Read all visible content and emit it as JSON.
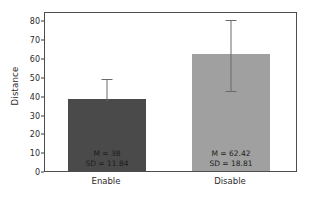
{
  "chart_data": {
    "type": "bar",
    "title": "",
    "xlabel": "",
    "ylabel": "Distance",
    "categories": [
      "Enable",
      "Disable"
    ],
    "values": [
      38,
      62.42
    ],
    "errors": [
      11.84,
      18.81
    ],
    "ylim": [
      0,
      85
    ],
    "yticks": [
      0,
      10,
      20,
      30,
      40,
      50,
      60,
      70,
      80
    ],
    "ytick_labels": [
      "0",
      "10",
      "20",
      "30",
      "40",
      "50",
      "60",
      "70",
      "80"
    ],
    "grid": false,
    "legend": "none",
    "series": [
      {
        "name": "Enable",
        "value": 38,
        "sd": 11.84,
        "color": "#4a4a4a",
        "annotation_mean": "M = 38",
        "annotation_sd": "SD = 11.84"
      },
      {
        "name": "Disable",
        "value": 62.42,
        "sd": 18.81,
        "color": "#a0a0a0",
        "annotation_mean": "M = 62.42",
        "annotation_sd": "SD = 18.81"
      }
    ]
  },
  "axis": {
    "y_title": "Distance"
  },
  "colors": {
    "bar_enable": "#4a4a4a",
    "bar_disable": "#a0a0a0",
    "frame": "#4d4d4d",
    "errorbar": "#6a6a6a",
    "background": "#ffffff",
    "text": "#2b2b2b"
  }
}
